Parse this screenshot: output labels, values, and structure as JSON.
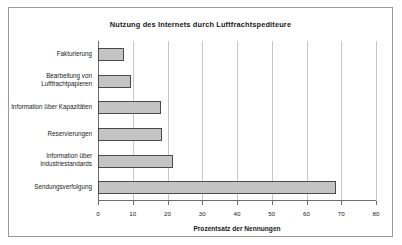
{
  "chart_data": {
    "type": "bar",
    "orientation": "horizontal",
    "title": "Nutzung des Internets durch Luftfrachtspediteure",
    "xlabel": "Prozentsatz der Nennungen",
    "ylabel": "",
    "xlim": [
      0,
      80
    ],
    "xticks": [
      0,
      10,
      20,
      30,
      40,
      50,
      60,
      70,
      80
    ],
    "xtick_labels": [
      "0",
      "10",
      "20",
      "30",
      "40",
      "50",
      "60",
      "70",
      "80"
    ],
    "grid": "vertical",
    "legend": "none",
    "categories": [
      "Fakturierung",
      "Bearbeitung von\nLuftfrachtpapieren",
      "Information über Kapazitäten",
      "Reservierungen",
      "Information über\nIndustriestandards",
      "Sendungsverfolgung"
    ],
    "values": [
      7.5,
      9.5,
      18,
      18.5,
      21.5,
      68.5
    ],
    "bar_fill": "#c4c4c4",
    "bar_border": "#4a4a4a",
    "gridline_color": "#c8c8c8",
    "axis_color": "#6e6e6e",
    "frame_color": "#9a9a9a",
    "background": "#ffffff"
  }
}
